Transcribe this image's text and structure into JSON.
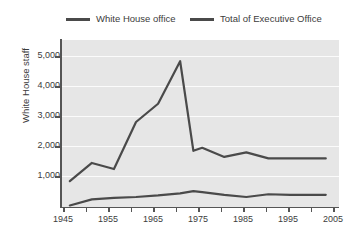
{
  "chart_data": {
    "type": "line",
    "title": "",
    "xlabel": "",
    "ylabel": "White House staff",
    "xlim": [
      1943,
      2006
    ],
    "ylim": [
      0,
      5500
    ],
    "grid": true,
    "legend_position": "top",
    "x_ticks": [
      1945,
      1955,
      1965,
      1975,
      1985,
      1995,
      2005
    ],
    "x_minor_ticks": [
      1950,
      1960,
      1970,
      1980,
      1990,
      2000
    ],
    "y_ticks": [
      1000,
      2000,
      3000,
      4000,
      5000
    ],
    "y_tick_labels": [
      "1,000",
      "2,000",
      "3,000",
      "4,000",
      "5,000"
    ],
    "series": [
      {
        "name": "White House office",
        "color": "#4a4a4a",
        "x": [
          1945,
          1950,
          1955,
          1960,
          1965,
          1970,
          1973,
          1975,
          1980,
          1985,
          1990,
          1995,
          2000,
          2003
        ],
        "values": [
          50,
          250,
          300,
          330,
          380,
          450,
          520,
          490,
          400,
          330,
          420,
          400,
          400,
          400
        ]
      },
      {
        "name": "Total of Executive Office",
        "color": "#4a4a4a",
        "x": [
          1945,
          1950,
          1955,
          1960,
          1965,
          1970,
          1973,
          1975,
          1980,
          1985,
          1990,
          1995,
          2000,
          2003
        ],
        "values": [
          850,
          1450,
          1250,
          2800,
          3400,
          4800,
          1850,
          1950,
          1650,
          1800,
          1600,
          1600,
          1600,
          1600
        ]
      }
    ]
  },
  "legend": {
    "items": [
      {
        "label": "White House office"
      },
      {
        "label": "Total of Executive Office"
      }
    ]
  },
  "axes": {
    "y_title": "White House staff",
    "y_labels": [
      "5,000",
      "4,000",
      "3,000",
      "2,000",
      "1,000"
    ],
    "x_labels": [
      "1945",
      "1955",
      "1965",
      "1975",
      "1985",
      "1995",
      "2005"
    ]
  },
  "colors": {
    "series_line": "#4a4a4a",
    "plot_background": "#e6e6e6",
    "gridline": "#fbfbfb",
    "axis": "#555555",
    "text": "#3c3c3c"
  }
}
